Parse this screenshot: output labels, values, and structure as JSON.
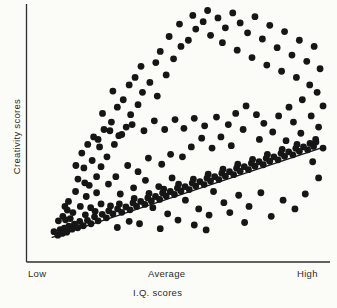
{
  "figure": {
    "background_color": "#fbfbf8",
    "ink_color": "#1a1a1a"
  },
  "axes": {
    "x_label": "I.Q. scores",
    "y_label": "Creativity scores",
    "x_tick_low": "Low",
    "x_tick_average": "Average",
    "x_tick_high": "High",
    "x_axis_name": "x-axis-line",
    "y_axis_name": "y-axis-line"
  },
  "chart_data": {
    "type": "scatter",
    "title": "",
    "subtitle": "",
    "xlabel": "I.Q. scores",
    "ylabel": "Creativity scores",
    "xlim": [
      0,
      100
    ],
    "ylim": [
      0,
      100
    ],
    "grid": false,
    "legend": "none",
    "xticks": [
      0,
      50,
      100
    ],
    "xticklabels": [
      "Low",
      "Average",
      "High"
    ],
    "yticks": [],
    "yticklabels": [],
    "annotations": [],
    "marker": {
      "shape": "circle",
      "color": "#161616",
      "radius_px": 3.4
    },
    "trendline": {
      "name": "regression-line",
      "color": "#161616",
      "width_px": 1.4,
      "x": [
        7.5,
        99.5
      ],
      "y": [
        7.5,
        44.0
      ]
    },
    "points": [
      [
        8.1,
        9.8
      ],
      [
        9.4,
        8.4
      ],
      [
        10.2,
        10.6
      ],
      [
        10.9,
        9.1
      ],
      [
        11.6,
        11.2
      ],
      [
        12.4,
        9.6
      ],
      [
        13.1,
        12.0
      ],
      [
        12.0,
        14.6
      ],
      [
        14.2,
        10.8
      ],
      [
        15.0,
        12.8
      ],
      [
        16.1,
        11.4
      ],
      [
        9.6,
        14.2
      ],
      [
        11.1,
        16.0
      ],
      [
        13.6,
        15.1
      ],
      [
        16.8,
        14.0
      ],
      [
        18.0,
        12.2
      ],
      [
        19.4,
        14.4
      ],
      [
        20.6,
        13.0
      ],
      [
        18.7,
        16.6
      ],
      [
        21.8,
        15.8
      ],
      [
        23.0,
        14.2
      ],
      [
        22.0,
        18.0
      ],
      [
        24.4,
        16.8
      ],
      [
        25.8,
        15.4
      ],
      [
        26.6,
        18.2
      ],
      [
        28.0,
        17.0
      ],
      [
        27.2,
        20.2
      ],
      [
        29.6,
        19.0
      ],
      [
        31.0,
        17.6
      ],
      [
        30.2,
        21.0
      ],
      [
        32.4,
        19.8
      ],
      [
        33.8,
        18.6
      ],
      [
        34.8,
        21.4
      ],
      [
        36.0,
        20.0
      ],
      [
        35.2,
        23.2
      ],
      [
        37.4,
        22.0
      ],
      [
        38.8,
        20.8
      ],
      [
        39.8,
        23.4
      ],
      [
        41.0,
        22.2
      ],
      [
        40.2,
        25.2
      ],
      [
        42.4,
        24.0
      ],
      [
        43.8,
        22.8
      ],
      [
        44.8,
        25.4
      ],
      [
        46.0,
        24.2
      ],
      [
        45.2,
        27.0
      ],
      [
        47.4,
        26.0
      ],
      [
        48.8,
        24.8
      ],
      [
        49.8,
        27.4
      ],
      [
        51.0,
        26.2
      ],
      [
        50.2,
        29.0
      ],
      [
        52.4,
        28.0
      ],
      [
        53.8,
        26.8
      ],
      [
        54.8,
        29.4
      ],
      [
        56.0,
        28.2
      ],
      [
        55.2,
        31.0
      ],
      [
        57.4,
        30.0
      ],
      [
        58.8,
        28.8
      ],
      [
        59.8,
        31.4
      ],
      [
        61.0,
        30.2
      ],
      [
        60.2,
        33.0
      ],
      [
        62.4,
        32.0
      ],
      [
        63.8,
        30.8
      ],
      [
        64.8,
        33.4
      ],
      [
        66.0,
        32.2
      ],
      [
        65.2,
        35.0
      ],
      [
        67.4,
        34.0
      ],
      [
        68.8,
        32.8
      ],
      [
        69.8,
        35.4
      ],
      [
        71.0,
        34.2
      ],
      [
        70.2,
        37.0
      ],
      [
        72.4,
        36.0
      ],
      [
        73.8,
        34.8
      ],
      [
        74.8,
        37.4
      ],
      [
        76.0,
        36.2
      ],
      [
        75.2,
        39.0
      ],
      [
        77.4,
        38.0
      ],
      [
        78.8,
        36.8
      ],
      [
        79.8,
        39.4
      ],
      [
        81.0,
        38.2
      ],
      [
        80.2,
        41.0
      ],
      [
        82.4,
        40.0
      ],
      [
        83.8,
        38.8
      ],
      [
        84.8,
        41.4
      ],
      [
        86.0,
        40.2
      ],
      [
        85.2,
        43.0
      ],
      [
        87.4,
        42.0
      ],
      [
        88.8,
        40.8
      ],
      [
        89.8,
        43.4
      ],
      [
        91.0,
        42.2
      ],
      [
        90.2,
        45.0
      ],
      [
        92.4,
        44.0
      ],
      [
        93.8,
        42.8
      ],
      [
        94.6,
        45.4
      ],
      [
        95.8,
        44.2
      ],
      [
        96.6,
        46.0
      ],
      [
        13.0,
        22.0
      ],
      [
        15.4,
        26.0
      ],
      [
        17.0,
        20.0
      ],
      [
        12.6,
        18.5
      ],
      [
        19.0,
        24.0
      ],
      [
        16.2,
        31.0
      ],
      [
        20.0,
        28.5
      ],
      [
        22.5,
        32.0
      ],
      [
        18.2,
        35.5
      ],
      [
        21.0,
        38.5
      ],
      [
        24.0,
        36.0
      ],
      [
        17.5,
        41.5
      ],
      [
        23.5,
        44.0
      ],
      [
        26.0,
        40.0
      ],
      [
        28.5,
        45.0
      ],
      [
        21.5,
        48.0
      ],
      [
        25.0,
        51.0
      ],
      [
        30.0,
        48.5
      ],
      [
        27.5,
        54.0
      ],
      [
        32.5,
        52.0
      ],
      [
        24.5,
        57.5
      ],
      [
        29.5,
        60.0
      ],
      [
        34.0,
        57.0
      ],
      [
        31.5,
        63.0
      ],
      [
        36.5,
        61.0
      ],
      [
        28.0,
        66.5
      ],
      [
        33.5,
        69.0
      ],
      [
        38.0,
        66.0
      ],
      [
        35.5,
        72.0
      ],
      [
        40.5,
        70.0
      ],
      [
        43.0,
        64.5
      ],
      [
        37.5,
        76.5
      ],
      [
        42.5,
        78.0
      ],
      [
        46.0,
        73.0
      ],
      [
        44.0,
        82.5
      ],
      [
        48.5,
        79.5
      ],
      [
        51.0,
        84.5
      ],
      [
        47.0,
        88.5
      ],
      [
        53.5,
        87.0
      ],
      [
        56.0,
        91.5
      ],
      [
        50.5,
        93.5
      ],
      [
        58.5,
        94.5
      ],
      [
        61.0,
        89.0
      ],
      [
        55.0,
        97.0
      ],
      [
        63.5,
        96.0
      ],
      [
        66.0,
        92.0
      ],
      [
        60.0,
        99.0
      ],
      [
        68.5,
        98.0
      ],
      [
        71.0,
        94.0
      ],
      [
        65.0,
        86.0
      ],
      [
        73.5,
        90.0
      ],
      [
        76.0,
        96.5
      ],
      [
        70.0,
        83.0
      ],
      [
        78.5,
        87.5
      ],
      [
        81.0,
        93.0
      ],
      [
        75.0,
        80.0
      ],
      [
        83.5,
        84.0
      ],
      [
        86.0,
        90.5
      ],
      [
        80.0,
        77.0
      ],
      [
        88.5,
        81.0
      ],
      [
        91.0,
        87.0
      ],
      [
        85.0,
        74.5
      ],
      [
        93.5,
        78.5
      ],
      [
        96.0,
        84.5
      ],
      [
        90.0,
        72.0
      ],
      [
        98.0,
        75.5
      ],
      [
        94.5,
        69.0
      ],
      [
        97.0,
        66.0
      ],
      [
        92.0,
        63.0
      ],
      [
        87.5,
        60.0
      ],
      [
        99.0,
        60.5
      ],
      [
        95.0,
        56.5
      ],
      [
        89.0,
        54.0
      ],
      [
        97.5,
        52.0
      ],
      [
        84.0,
        56.5
      ],
      [
        91.5,
        49.5
      ],
      [
        86.5,
        46.5
      ],
      [
        96.5,
        47.0
      ],
      [
        82.0,
        50.0
      ],
      [
        79.0,
        53.5
      ],
      [
        76.5,
        57.0
      ],
      [
        73.0,
        60.5
      ],
      [
        69.5,
        57.5
      ],
      [
        72.0,
        51.0
      ],
      [
        77.5,
        47.0
      ],
      [
        67.0,
        53.0
      ],
      [
        63.0,
        56.0
      ],
      [
        59.0,
        52.5
      ],
      [
        64.5,
        48.0
      ],
      [
        68.0,
        44.5
      ],
      [
        55.5,
        55.5
      ],
      [
        52.0,
        51.5
      ],
      [
        58.0,
        47.5
      ],
      [
        61.5,
        43.5
      ],
      [
        49.0,
        55.0
      ],
      [
        45.5,
        51.0
      ],
      [
        54.5,
        44.0
      ],
      [
        51.5,
        40.0
      ],
      [
        42.0,
        54.5
      ],
      [
        38.5,
        50.5
      ],
      [
        47.5,
        41.0
      ],
      [
        44.5,
        37.0
      ],
      [
        34.5,
        53.0
      ],
      [
        31.0,
        49.0
      ],
      [
        40.0,
        39.5
      ],
      [
        36.5,
        34.0
      ],
      [
        27.0,
        50.5
      ],
      [
        23.0,
        47.0
      ],
      [
        33.0,
        36.5
      ],
      [
        29.0,
        32.0
      ],
      [
        19.5,
        45.0
      ],
      [
        26.5,
        29.0
      ],
      [
        22.5,
        25.5
      ],
      [
        15.5,
        36.5
      ],
      [
        18.5,
        29.5
      ],
      [
        24.0,
        21.0
      ],
      [
        20.5,
        19.5
      ],
      [
        30.5,
        25.0
      ],
      [
        35.0,
        27.5
      ],
      [
        39.0,
        30.5
      ],
      [
        43.5,
        28.0
      ],
      [
        48.0,
        31.5
      ],
      [
        41.5,
        19.5
      ],
      [
        46.5,
        17.0
      ],
      [
        52.5,
        22.5
      ],
      [
        57.0,
        19.0
      ],
      [
        50.0,
        14.5
      ],
      [
        55.5,
        12.5
      ],
      [
        60.5,
        16.5
      ],
      [
        65.5,
        21.5
      ],
      [
        62.0,
        26.0
      ],
      [
        70.5,
        24.5
      ],
      [
        67.5,
        17.5
      ],
      [
        74.0,
        20.0
      ],
      [
        78.0,
        25.5
      ],
      [
        72.5,
        13.5
      ],
      [
        81.5,
        16.0
      ],
      [
        85.5,
        22.5
      ],
      [
        89.5,
        19.0
      ],
      [
        93.0,
        25.0
      ],
      [
        97.5,
        31.5
      ],
      [
        95.5,
        38.0
      ],
      [
        99.0,
        43.5
      ],
      [
        33.5,
        14.0
      ],
      [
        37.0,
        13.0
      ],
      [
        29.5,
        11.5
      ],
      [
        44.0,
        11.0
      ],
      [
        59.5,
        10.5
      ],
      [
        11.8,
        20.0
      ],
      [
        14.5,
        17.5
      ]
    ]
  }
}
